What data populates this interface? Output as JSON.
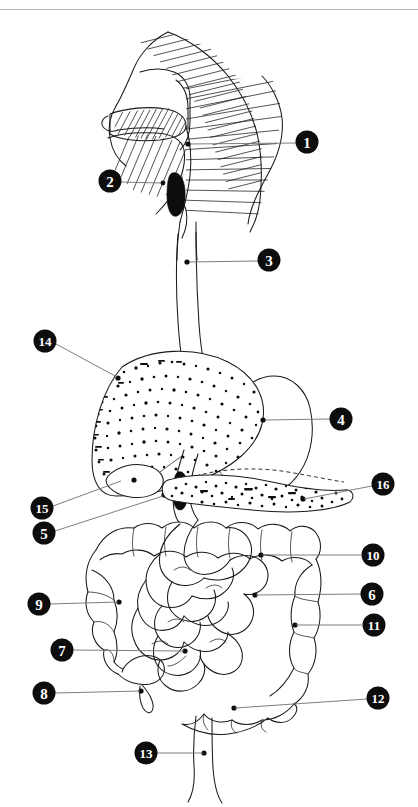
{
  "header": {
    "faint_text": ""
  },
  "figure": {
    "style": "black and white line drawing with stipple and hatch shading",
    "label_count": 16
  },
  "labels": [
    {
      "id": "1",
      "number": "1",
      "name": "pharynx-label",
      "marker": {
        "cx": 307,
        "cy": 132
      },
      "anchor": {
        "x": 188,
        "y": 134
      },
      "leader": [
        [
          296,
          133
        ],
        [
          189,
          134
        ]
      ]
    },
    {
      "id": "2",
      "number": "2",
      "name": "epiglottis-label",
      "marker": {
        "cx": 110,
        "cy": 171
      },
      "anchor": {
        "x": 163,
        "y": 173
      },
      "leader": [
        [
          121,
          172
        ],
        [
          162,
          173
        ]
      ]
    },
    {
      "id": "3",
      "number": "3",
      "name": "esophagus-label",
      "marker": {
        "cx": 269,
        "cy": 250
      },
      "anchor": {
        "x": 187,
        "y": 252
      },
      "leader": [
        [
          258,
          251
        ],
        [
          188,
          252
        ]
      ]
    },
    {
      "4": "",
      "id": "4",
      "number": "4",
      "name": "stomach-label",
      "marker": {
        "cx": 341,
        "cy": 409
      },
      "anchor": {
        "x": 263,
        "y": 410
      },
      "leader": [
        [
          330,
          409
        ],
        [
          264,
          410
        ]
      ]
    },
    {
      "id": "5",
      "number": "5",
      "name": "duodenum-label",
      "marker": {
        "cx": 44,
        "cy": 523
      },
      "anchor": {
        "x": 164,
        "y": 485
      },
      "leader": [
        [
          55,
          521
        ],
        [
          163,
          486
        ]
      ]
    },
    {
      "id": "6",
      "number": "6",
      "name": "small-intestine-label",
      "marker": {
        "cx": 372,
        "cy": 584
      },
      "anchor": {
        "x": 255,
        "y": 585
      },
      "leader": [
        [
          361,
          584
        ],
        [
          256,
          585
        ]
      ]
    },
    {
      "id": "7",
      "number": "7",
      "name": "ileum-label",
      "marker": {
        "cx": 62,
        "cy": 640
      },
      "anchor": {
        "x": 185,
        "y": 641
      },
      "leader": [
        [
          73,
          640
        ],
        [
          184,
          641
        ]
      ]
    },
    {
      "id": "8",
      "number": "8",
      "name": "appendix-label",
      "marker": {
        "cx": 44,
        "cy": 683
      },
      "anchor": {
        "x": 141,
        "y": 681
      },
      "leader": [
        [
          55,
          683
        ],
        [
          140,
          681
        ]
      ]
    },
    {
      "id": "9",
      "number": "9",
      "name": "ascending-colon-label",
      "marker": {
        "cx": 39,
        "cy": 594
      },
      "anchor": {
        "x": 119,
        "y": 592
      },
      "leader": [
        [
          50,
          594
        ],
        [
          118,
          592
        ]
      ]
    },
    {
      "id": "10",
      "number": "10",
      "name": "transverse-colon-label",
      "marker": {
        "cx": 373,
        "cy": 545
      },
      "anchor": {
        "x": 261,
        "y": 545
      },
      "leader": [
        [
          361,
          545
        ],
        [
          262,
          545
        ]
      ]
    },
    {
      "id": "11",
      "number": "11",
      "name": "descending-colon-label",
      "marker": {
        "cx": 374,
        "cy": 615
      },
      "anchor": {
        "x": 295,
        "y": 615
      },
      "leader": [
        [
          362,
          615
        ],
        [
          296,
          615
        ]
      ]
    },
    {
      "id": "12",
      "number": "12",
      "name": "sigmoid-colon-label",
      "marker": {
        "cx": 378,
        "cy": 688
      },
      "anchor": {
        "x": 234,
        "y": 698
      },
      "leader": [
        [
          367,
          689
        ],
        [
          235,
          698
        ]
      ]
    },
    {
      "id": "13",
      "number": "13",
      "name": "rectum-label",
      "marker": {
        "cx": 146,
        "cy": 743
      },
      "anchor": {
        "x": 204,
        "y": 743
      },
      "leader": [
        [
          157,
          743
        ],
        [
          203,
          743
        ]
      ]
    },
    {
      "id": "14",
      "number": "14",
      "name": "liver-label",
      "marker": {
        "cx": 45,
        "cy": 331
      },
      "anchor": {
        "x": 118,
        "y": 368
      },
      "leader": [
        [
          56,
          334
        ],
        [
          117,
          367
        ]
      ]
    },
    {
      "id": "15",
      "number": "15",
      "name": "gallbladder-label",
      "marker": {
        "cx": 42,
        "cy": 498
      },
      "anchor": {
        "x": 122,
        "y": 470
      },
      "leader": [
        [
          53,
          496
        ],
        [
          121,
          471
        ]
      ]
    },
    {
      "id": "16",
      "number": "16",
      "name": "pancreas-label",
      "marker": {
        "cx": 383,
        "cy": 474
      },
      "anchor": {
        "x": 303,
        "y": 489
      },
      "leader": [
        [
          372,
          476
        ],
        [
          304,
          489
        ]
      ]
    }
  ],
  "colors": {
    "ink": "#1a1a1a",
    "leader": "#6f6f6f",
    "marker_fill": "#0d0d0d",
    "marker_text": "#ffffff",
    "background": "#ffffff",
    "rule": "#b9b9b9"
  }
}
